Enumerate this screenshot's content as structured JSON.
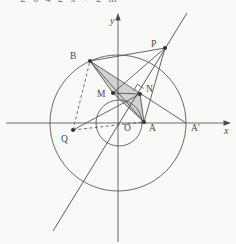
{
  "page": {
    "clipped_text": "— 2 6 4 2  x + 2  m"
  },
  "figure": {
    "colors": {
      "stroke": "#4a4a4a",
      "circle_stroke": "#5a5a5a",
      "dot_fill": "#333333",
      "shade_fill": "#c7c7c7",
      "label_color": "#4a4a4a"
    },
    "axes": {
      "x_label": "x",
      "y_label": "y",
      "x_axis": {
        "x1": 6,
        "y1": 123,
        "x2": 229,
        "y2": 123
      },
      "y_axis": {
        "x1": 118,
        "y1": 242,
        "x2": 118,
        "y2": 17
      },
      "x_label_pos": {
        "x": 224,
        "y": 134
      },
      "y_label_pos": {
        "x": 110,
        "y": 24
      },
      "x_arrow": "231,123 223.5,120.3 223.5,125.7",
      "y_arrow": "118,13 115.3,20.5 120.7,20.5"
    },
    "circles": [
      {
        "name": "big-circle",
        "cx": 118,
        "cy": 123,
        "r": 68
      },
      {
        "name": "small-circle",
        "cx": 119,
        "cy": 123,
        "r": 23
      }
    ],
    "points": [
      {
        "name": "O",
        "label": "O",
        "x": 118,
        "y": 123,
        "lx": 124,
        "ly": 131,
        "dot": false
      },
      {
        "name": "A",
        "label": "A",
        "x": 144,
        "y": 122,
        "lx": 149,
        "ly": 131,
        "dot": true
      },
      {
        "name": "Ap",
        "label": "A′",
        "x": 186,
        "y": 123,
        "lx": 191,
        "ly": 131,
        "dot": false
      },
      {
        "name": "B",
        "label": "B",
        "x": 90,
        "y": 61,
        "lx": 70,
        "ly": 59,
        "dot": true
      },
      {
        "name": "P",
        "label": "P",
        "x": 165,
        "y": 48,
        "lx": 151,
        "ly": 47,
        "dot": true
      },
      {
        "name": "M",
        "label": "M",
        "x": 113,
        "y": 93,
        "lx": 97,
        "ly": 97,
        "dot": true
      },
      {
        "name": "N",
        "label": "N",
        "x": 140,
        "y": 94,
        "lx": 146,
        "ly": 92,
        "dot": true
      },
      {
        "name": "Q",
        "label": "Q",
        "x": 73,
        "y": 130,
        "lx": 61,
        "ly": 142,
        "dot": true
      }
    ],
    "segments": [
      {
        "from": "B",
        "to": "P"
      },
      {
        "from": "B",
        "to": "Ap"
      },
      {
        "from": "B",
        "to": "M"
      },
      {
        "from": "B",
        "to": "A"
      },
      {
        "from": "M",
        "to": "N"
      },
      {
        "from": "M",
        "to": "A"
      },
      {
        "from": "N",
        "to": "A"
      },
      {
        "from": "P",
        "to": "M"
      },
      {
        "from": "P",
        "to": "A"
      },
      {
        "from": "Q",
        "to": "N"
      }
    ],
    "dashed_segments": [
      {
        "from": "Q",
        "to": "B"
      },
      {
        "from": "Q",
        "to": "A"
      }
    ],
    "long_line": {
      "x1": 187,
      "y1": 13,
      "x2": 53,
      "y2": 231
    },
    "shade_polygon": [
      "B",
      "M",
      "A",
      "N"
    ],
    "right_angle_mark": "M143.5 88.4 L137.3 84.2 L133.8 90.8"
  }
}
